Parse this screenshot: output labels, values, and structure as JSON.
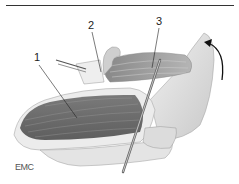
{
  "figure": {
    "labels": [
      {
        "id": "1",
        "text": "1"
      },
      {
        "id": "2",
        "text": "2"
      },
      {
        "id": "3",
        "text": "3"
      }
    ],
    "logo": "EMC",
    "colors": {
      "muscle_dark": "#6a6a6a",
      "muscle_mid": "#8c8c8c",
      "tissue_light": "#d8d8d8",
      "outline": "#9a9a9a",
      "rule": "#333333"
    }
  }
}
